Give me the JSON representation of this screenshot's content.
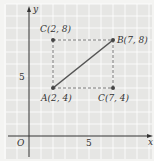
{
  "diagram": {
    "type": "coordinate-plane",
    "axes": {
      "x_label": "x",
      "y_label": "y",
      "origin_label": "O",
      "x_tick": "5",
      "y_tick": "5"
    },
    "points": [
      {
        "name": "A",
        "label": "A(2, 4)",
        "x": 2,
        "y": 4
      },
      {
        "name": "B",
        "label": "B(7, 8)",
        "x": 7,
        "y": 8
      },
      {
        "name": "C1",
        "label": "C(2, 8)",
        "x": 2,
        "y": 8
      },
      {
        "name": "C2",
        "label": "C(7, 4)",
        "x": 7,
        "y": 4
      }
    ],
    "segments": [
      {
        "from": "A",
        "to": "B",
        "style": "solid"
      },
      {
        "from": "A",
        "to": "C1",
        "style": "dashed"
      },
      {
        "from": "C1",
        "to": "B",
        "style": "dashed"
      },
      {
        "from": "A",
        "to": "C2",
        "style": "dashed"
      },
      {
        "from": "C2",
        "to": "B",
        "style": "dashed"
      }
    ],
    "colors": {
      "grid": "#ffffff",
      "background": "#e8e8e6",
      "line": "#555555",
      "point": "#444444"
    }
  }
}
